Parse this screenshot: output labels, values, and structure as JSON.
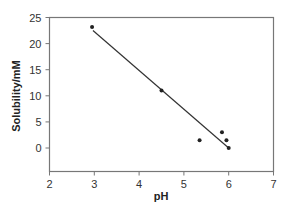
{
  "chart_data": {
    "type": "scatter",
    "title": "",
    "xlabel": "pH",
    "ylabel": "Solubility/mM",
    "xlim": [
      2,
      7
    ],
    "ylim": [
      -4.5,
      25
    ],
    "xticks": [
      2,
      3,
      4,
      5,
      6,
      7
    ],
    "yticks": [
      0,
      5,
      10,
      15,
      20,
      25
    ],
    "grid": false,
    "legend": null,
    "series": [
      {
        "name": "measured",
        "kind": "scatter",
        "points": [
          {
            "x": 2.95,
            "y": 23.2
          },
          {
            "x": 4.5,
            "y": 11.0
          },
          {
            "x": 5.35,
            "y": 1.5
          },
          {
            "x": 5.85,
            "y": 3.0
          },
          {
            "x": 5.95,
            "y": 1.5
          },
          {
            "x": 6.0,
            "y": 0.0
          }
        ]
      },
      {
        "name": "linear fit",
        "kind": "line",
        "points": [
          {
            "x": 2.97,
            "y": 22.5
          },
          {
            "x": 6.0,
            "y": 0.0
          }
        ]
      }
    ]
  }
}
